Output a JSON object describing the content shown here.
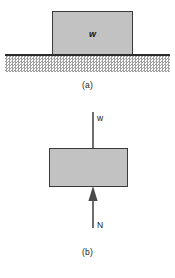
{
  "figure": {
    "type": "physics-free-body-diagram",
    "panels": [
      {
        "id": "a",
        "caption": "(a)",
        "block_label": "w",
        "description": "block resting on hatched ground surface",
        "elements": [
          "block",
          "ground-line",
          "ground-hatching"
        ]
      },
      {
        "id": "b",
        "caption": "(b)",
        "description": "free-body diagram of the block",
        "forces": [
          {
            "name": "w",
            "label": "w",
            "direction": "down"
          },
          {
            "name": "N",
            "label": "N",
            "direction": "up"
          }
        ]
      }
    ]
  },
  "colors": {
    "block_fill": "#c2c2c2",
    "block_stroke": "#3a3a3a",
    "ground_line": "#2b2b2b",
    "hatch": "#9b9b9b",
    "arrow": "#4a4a4a",
    "text": "#1a1a1a"
  }
}
